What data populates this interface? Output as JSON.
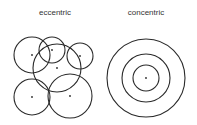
{
  "panels": [
    {
      "label": "eccentric",
      "circles": [
        {
          "cx": 32,
          "cy": 55,
          "r": 18
        },
        {
          "cx": 52,
          "cy": 50,
          "r": 13
        },
        {
          "cx": 80,
          "cy": 56,
          "r": 13
        },
        {
          "cx": 57,
          "cy": 68,
          "r": 24
        },
        {
          "cx": 32,
          "cy": 97,
          "r": 18
        },
        {
          "cx": 70,
          "cy": 96,
          "r": 22
        }
      ]
    },
    {
      "label": "concentric",
      "circles": [
        {
          "cx": 146,
          "cy": 78,
          "r": 13
        },
        {
          "cx": 146,
          "cy": 78,
          "r": 24
        },
        {
          "cx": 146,
          "cy": 78,
          "r": 39
        }
      ]
    }
  ],
  "style": {
    "stroke": "#2a2a2a",
    "dot": "#2a2a2a"
  }
}
